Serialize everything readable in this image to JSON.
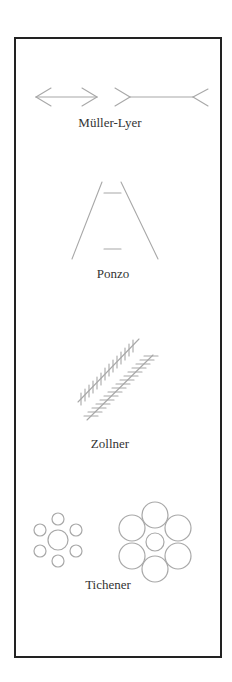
{
  "colors": {
    "frame": "#222222",
    "figure_lines": "#a8a8a8",
    "label_text": "#333333",
    "background": "#ffffff"
  },
  "illusions": [
    {
      "id": "muller-lyer",
      "label": "Müller-Lyer"
    },
    {
      "id": "ponzo",
      "label": "Ponzo"
    },
    {
      "id": "zollner",
      "label": "Zollner"
    },
    {
      "id": "tichener",
      "label": "Tichener"
    }
  ]
}
